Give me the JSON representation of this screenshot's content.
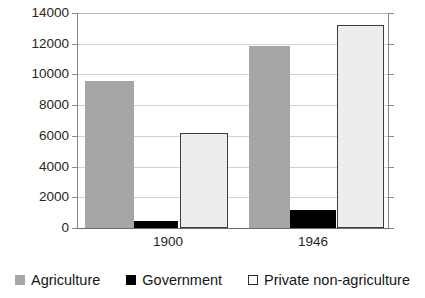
{
  "chart_data": {
    "type": "bar",
    "title": "",
    "subtitle": "",
    "xlabel": "",
    "ylabel": "",
    "categories": [
      "1900",
      "1946"
    ],
    "series": [
      {
        "name": "Agriculture",
        "color": "#a6a6a6",
        "values": [
          9600,
          11850
        ]
      },
      {
        "name": "Government",
        "color": "#000000",
        "values": [
          450,
          1170
        ]
      },
      {
        "name": "Private non-agriculture",
        "color": "#ffffff",
        "values": [
          6180,
          13220
        ]
      }
    ],
    "ylim": [
      0,
      14000
    ],
    "ytick_labels": [
      "14000",
      "12000",
      "10000",
      "8000",
      "6000",
      "4000",
      "2000",
      "0"
    ],
    "ytick_values": [
      14000,
      12000,
      10000,
      8000,
      6000,
      4000,
      2000,
      0
    ],
    "ytick_step": 2000,
    "grid": "horizontal",
    "legend_position": "bottom"
  },
  "axes": {
    "y_labels": [
      "14000",
      "12000",
      "10000",
      "8000",
      "6000",
      "4000",
      "2000",
      "0"
    ],
    "x_labels": [
      "1900",
      "1946"
    ]
  },
  "legend": {
    "items": [
      {
        "label": "Agriculture",
        "swatch": "gray-square-swatch"
      },
      {
        "label": "Government",
        "swatch": "black-square-swatch"
      },
      {
        "label": "Private non-agriculture",
        "swatch": "white-square-swatch"
      }
    ]
  },
  "colors": {
    "agriculture": "#a6a6a6",
    "government": "#000000",
    "private_non_agriculture": "#ffffff",
    "private_border": "#3d3d3d",
    "gridline": "#d2d2d2",
    "axis": "#6e6e6e",
    "text": "#151515"
  }
}
